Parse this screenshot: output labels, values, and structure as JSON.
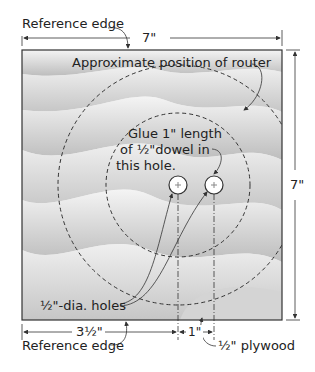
{
  "diagram": {
    "title_labels": {
      "reference_edge_top": "Reference edge",
      "reference_edge_bottom": "Reference edge",
      "router_position": "Approximate position of router",
      "glue_note_line1": "Glue 1\" length",
      "glue_note_line2": "of ½\"dowel in",
      "glue_note_line3": "this hole.",
      "holes": "½\"-dia. holes",
      "plywood": "½\" plywood"
    },
    "dimensions": {
      "width": "7\"",
      "height": "7\"",
      "hole_offset": "3½\"",
      "hole_spacing": "1\""
    },
    "colors": {
      "line": "#333333",
      "board_light": "#f2f2f2",
      "board_dark": "#c8c8c8"
    }
  }
}
